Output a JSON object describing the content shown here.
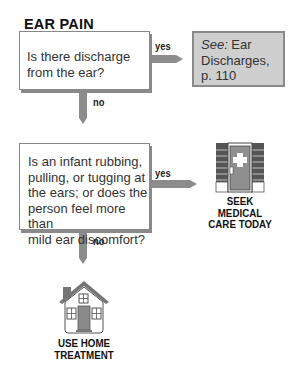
{
  "title": "EAR PAIN",
  "questions": [
    {
      "text": "Is there discharge from the ear?",
      "lines": [
        "Is there discharge",
        "from the ear?"
      ]
    },
    {
      "text": "Is an infant rubbing, pulling, or tugging at the ears; or does the person feel more than mild ear discomfort?",
      "lines": [
        "Is an infant rubbing,",
        "pulling, or tugging at",
        "the ears; or does the",
        "person feel more than",
        "mild ear discomfort?"
      ]
    }
  ],
  "labels": {
    "yes": "yes",
    "no": "no"
  },
  "reference": {
    "see": "See:",
    "line1_rest": " Ear",
    "line2": "Discharges,",
    "line3": "p. 110"
  },
  "outcomes": {
    "seek_care": {
      "icon": "medical-office-icon",
      "lines": [
        "SEEK",
        "MEDICAL",
        "CARE TODAY"
      ]
    },
    "home_treatment": {
      "icon": "house-icon",
      "lines": [
        "USE HOME",
        "TREATMENT"
      ]
    }
  },
  "colors": {
    "arrow": "#8c8c8c",
    "reference_box": "#cfcfcf",
    "box_border": "#888888"
  }
}
